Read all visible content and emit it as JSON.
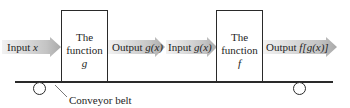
{
  "diagram": {
    "arrows": [
      {
        "id": "input-x",
        "label_prefix": "Input ",
        "label_var": "x"
      },
      {
        "id": "output-gx",
        "label_prefix": "Output ",
        "label_var": "g(x)"
      },
      {
        "id": "input-gx",
        "label_prefix": "Input ",
        "label_var": "g(x)"
      },
      {
        "id": "output-fgx",
        "label_prefix": "Output ",
        "label_var": "f[g(x)]"
      }
    ],
    "boxes": [
      {
        "id": "function-g",
        "line1": "The",
        "line2": "function",
        "name": "g"
      },
      {
        "id": "function-f",
        "line1": "The",
        "line2": "function",
        "name": "f"
      }
    ],
    "belt_label": "Conveyor belt",
    "colors": {
      "arrow_dark": "#b4b4b4",
      "arrow_light": "#f4f4f4",
      "stroke": "#2a2a2a"
    }
  }
}
